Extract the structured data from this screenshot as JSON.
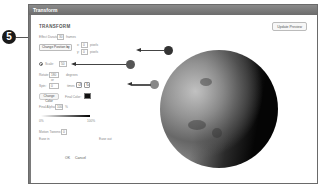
{
  "step_badge": "5",
  "window": {
    "title": "Transform"
  },
  "dialog": {
    "heading": "TRANSFORM",
    "update_preview_label": "Update Preview",
    "effect_duration": {
      "label": "Effect Duration:",
      "value": "30",
      "unit": "frames"
    },
    "position": {
      "dropdown_value": "Change Position by",
      "x": {
        "label": "x:",
        "value": "0",
        "unit": "pixels"
      },
      "y": {
        "label": "y:",
        "value": "0",
        "unit": "pixels"
      }
    },
    "scale": {
      "label": "Scale:",
      "value": "50"
    },
    "rotate": {
      "label": "Rotate:",
      "value": "180",
      "unit": "degrees"
    },
    "or_label": "or",
    "spin": {
      "label": "Spin:",
      "value": "0",
      "unit": "times"
    },
    "rotation_icons": [
      "rotate-ccw-icon",
      "rotate-cw-icon"
    ],
    "change_color_label": "Change Color",
    "final_color_label": "Final Color:",
    "final_color_value": "#000000",
    "final_alpha": {
      "label": "Final Alpha:",
      "value": "100",
      "unit": "%"
    },
    "alpha_slider": {
      "min_label": "0%",
      "max_label": "100%"
    },
    "motion_tweens": {
      "label": "Motion Tweens:",
      "value": "0"
    },
    "ease_in_label": "Ease in",
    "ease_out_label": "Ease out",
    "ok_label": "OK",
    "cancel_label": "Cancel"
  }
}
